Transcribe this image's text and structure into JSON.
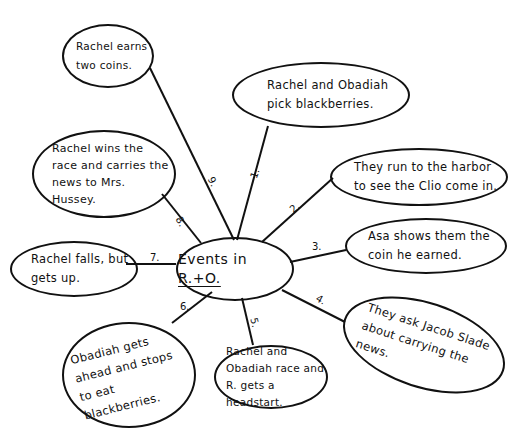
{
  "title": "Events in R.+O.",
  "center": {
    "prefix": "Events in",
    "underlined": "R.+O."
  },
  "events": [
    {
      "num": "1.",
      "text": "Rachel and Obadiah pick blackberries."
    },
    {
      "num": "2.",
      "text": "They run to the harbor to see the Clio come in."
    },
    {
      "num": "3.",
      "text": "Asa shows them the coin he earned."
    },
    {
      "num": "4.",
      "text": "They ask Jacob Slade about carrying the news."
    },
    {
      "num": "5.",
      "text": "Rachel and Obadiah race and R. gets a headstart."
    },
    {
      "num": "6.",
      "text": "Obadiah gets ahead and stops to eat blackberries."
    },
    {
      "num": "7.",
      "text": "Rachel falls, but gets up."
    },
    {
      "num": "8.",
      "text": "Rachel wins the race and carries the news to Mrs. Hussey."
    },
    {
      "num": "9.",
      "text": "Rachel earns two coins."
    }
  ]
}
